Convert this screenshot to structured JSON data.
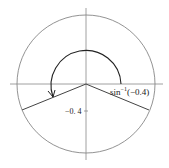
{
  "diagram": {
    "type": "unit-circle",
    "labels": {
      "angle_label_base": "sin",
      "angle_label_sup": "−1",
      "angle_label_arg": "(−0.4)",
      "y_value_label": "−0. 4"
    },
    "colors": {
      "circle": "#777777",
      "axes": "#888888",
      "rays": "#444444",
      "arc": "#222222"
    }
  }
}
